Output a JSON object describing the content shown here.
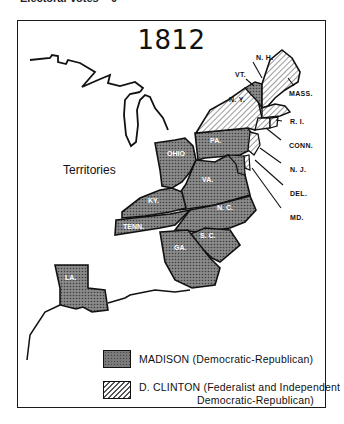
{
  "caption": "Electoral Votes – 0",
  "map": {
    "title": "1812",
    "region_label": "Territories",
    "states": [
      {
        "abbr": "N. H.",
        "winner": "clinton"
      },
      {
        "abbr": "VT.",
        "winner": "madison"
      },
      {
        "abbr": "N. Y.",
        "winner": "clinton"
      },
      {
        "abbr": "MASS.",
        "winner": "clinton"
      },
      {
        "abbr": "R. I.",
        "winner": "clinton"
      },
      {
        "abbr": "CONN.",
        "winner": "clinton"
      },
      {
        "abbr": "N. J.",
        "winner": "clinton"
      },
      {
        "abbr": "DEL.",
        "winner": "clinton"
      },
      {
        "abbr": "MD.",
        "winner": "split"
      },
      {
        "abbr": "PA.",
        "winner": "madison"
      },
      {
        "abbr": "OHIO",
        "winner": "madison"
      },
      {
        "abbr": "VA.",
        "winner": "madison"
      },
      {
        "abbr": "KY.",
        "winner": "madison"
      },
      {
        "abbr": "N. C.",
        "winner": "madison"
      },
      {
        "abbr": "TENN.",
        "winner": "madison"
      },
      {
        "abbr": "S. C.",
        "winner": "madison"
      },
      {
        "abbr": "GA.",
        "winner": "madison"
      },
      {
        "abbr": "LA.",
        "winner": "madison"
      }
    ]
  },
  "legend": {
    "madison": {
      "label": "MADISON (Democratic-Republican)",
      "color": "#7a7a7a",
      "pattern": "stipple"
    },
    "clinton": {
      "label_line1": "D. CLINTON (Federalist and Independent",
      "label_line2": "Democratic-Republican)",
      "color": "#ffffff",
      "pattern": "diagonal-hatch"
    }
  }
}
